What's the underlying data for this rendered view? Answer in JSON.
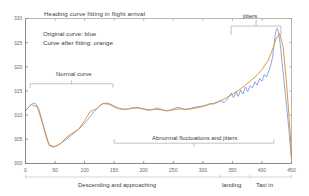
{
  "chart_data": {
    "type": "line",
    "title": "Heading curve fitting in flight arrival",
    "xlabel": "",
    "ylabel": "",
    "xlim": [
      0,
      450
    ],
    "ylim": [
      300,
      330
    ],
    "grid": false,
    "legend_position": "upper-left-inside",
    "legend": [
      {
        "label": "Original curve: blue",
        "color": "#3b6fd4",
        "series": "original"
      },
      {
        "label": "Curve after fitting: orange",
        "color": "#e08a2e",
        "series": "fitted"
      }
    ],
    "xticks": [
      0,
      50,
      100,
      150,
      200,
      250,
      300,
      350,
      400,
      450
    ],
    "yticks": [
      300,
      305,
      310,
      315,
      320,
      325,
      330
    ],
    "annotations": [
      {
        "text": "Normal curve",
        "x": 75,
        "y": 316.5,
        "bracket": [
          8,
          148
        ]
      },
      {
        "text": "Abnormal fluctuations and jitters",
        "x": 270,
        "y": 304.2,
        "bracket": [
          150,
          420
        ]
      },
      {
        "text": "jitters",
        "x": 392,
        "y": 330.6,
        "bracket": [
          348,
          432
        ]
      }
    ],
    "phases": [
      {
        "label": "Descending and approaching",
        "from": 0,
        "to": 330
      },
      {
        "label": "landing",
        "from": 330,
        "to": 380
      },
      {
        "label": "Taxi in",
        "from": 380,
        "to": 450
      }
    ],
    "series": [
      {
        "name": "original",
        "color": "#3b6fd4",
        "x": [
          0,
          5,
          10,
          14,
          18,
          22,
          26,
          30,
          34,
          38,
          42,
          46,
          50,
          55,
          60,
          66,
          72,
          78,
          84,
          90,
          96,
          102,
          108,
          114,
          120,
          126,
          132,
          138,
          144,
          150,
          156,
          162,
          168,
          174,
          180,
          186,
          192,
          198,
          204,
          210,
          216,
          222,
          228,
          234,
          240,
          246,
          252,
          258,
          264,
          270,
          276,
          282,
          288,
          294,
          300,
          306,
          312,
          318,
          324,
          330,
          336,
          342,
          348,
          352,
          356,
          360,
          364,
          368,
          372,
          376,
          380,
          384,
          388,
          392,
          396,
          400,
          404,
          408,
          412,
          415,
          418,
          420,
          422,
          424,
          426,
          428,
          430,
          432,
          434,
          436,
          438,
          440,
          442,
          444,
          446,
          448,
          450
        ],
        "y": [
          310.9,
          311.6,
          312.3,
          312.5,
          312.3,
          311.4,
          309.8,
          307.8,
          305.9,
          304.4,
          303.6,
          303.4,
          303.5,
          303.8,
          304.2,
          304.7,
          305.3,
          305.9,
          306.5,
          307.1,
          307.8,
          308.6,
          309.5,
          310.4,
          311.3,
          312.0,
          312.4,
          312.5,
          312.3,
          311.9,
          311.5,
          311.3,
          311.2,
          311.3,
          311.5,
          311.6,
          311.5,
          311.3,
          311.1,
          311.0,
          311.2,
          311.5,
          311.3,
          311.0,
          310.9,
          311.1,
          311.4,
          311.6,
          311.4,
          311.2,
          311.3,
          311.5,
          311.7,
          311.8,
          311.9,
          312.1,
          312.4,
          312.3,
          312.6,
          313.0,
          312.6,
          313.4,
          314.6,
          313.6,
          314.9,
          313.9,
          315.2,
          314.4,
          315.8,
          314.9,
          316.1,
          315.6,
          316.9,
          316.2,
          317.6,
          317.0,
          318.4,
          317.9,
          319.3,
          320.4,
          322.0,
          324.0,
          326.2,
          327.6,
          327.9,
          327.2,
          325.6,
          323.4,
          321.0,
          318.6,
          316.2,
          314.0,
          311.5,
          309.0,
          306.4,
          303.6,
          301.0
        ]
      },
      {
        "name": "fitted",
        "color": "#e08a2e",
        "x": [
          0,
          10,
          20,
          30,
          40,
          50,
          60,
          70,
          80,
          90,
          100,
          110,
          120,
          130,
          140,
          150,
          160,
          170,
          180,
          190,
          200,
          210,
          220,
          230,
          240,
          250,
          260,
          270,
          280,
          290,
          300,
          310,
          320,
          330,
          340,
          350,
          360,
          370,
          380,
          390,
          400,
          410,
          418,
          424,
          430,
          436,
          442,
          448,
          450
        ],
        "y": [
          311.0,
          312.2,
          311.7,
          307.9,
          303.8,
          303.5,
          304.2,
          305.5,
          306.3,
          307.1,
          308.9,
          310.8,
          311.3,
          312.4,
          312.3,
          311.7,
          311.3,
          311.2,
          311.4,
          311.5,
          311.3,
          311.1,
          311.2,
          311.1,
          310.9,
          311.1,
          311.3,
          311.2,
          311.3,
          311.5,
          311.8,
          312.2,
          312.5,
          313.0,
          313.6,
          314.3,
          315.1,
          316.0,
          317.0,
          318.1,
          319.4,
          321.2,
          323.6,
          325.8,
          326.9,
          324.0,
          316.0,
          306.0,
          301.0
        ]
      }
    ]
  }
}
